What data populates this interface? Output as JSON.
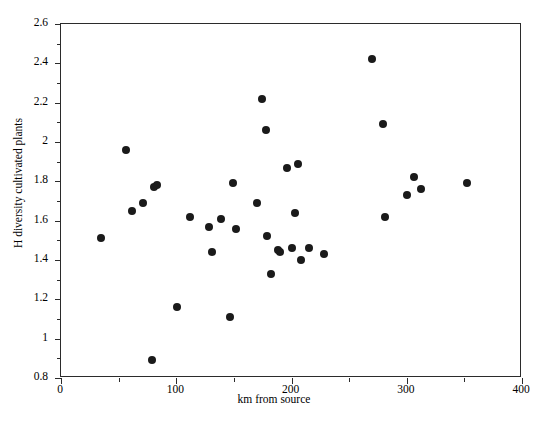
{
  "chart_data": {
    "type": "scatter",
    "title": "",
    "xlabel": "km from source",
    "ylabel": "H diversity cultivated plants",
    "xlim": [
      0,
      400
    ],
    "ylim": [
      0.8,
      2.6
    ],
    "x_major_ticks": [
      0,
      100,
      200,
      300,
      400
    ],
    "x_minor_ticks": [
      50,
      150,
      250,
      350
    ],
    "y_major_ticks": [
      0.8,
      1,
      1.2,
      1.4,
      1.6,
      1.8,
      2,
      2.2,
      2.4,
      2.6
    ],
    "y_minor_ticks": [
      0.9,
      1.1,
      1.3,
      1.5,
      1.7,
      1.9,
      2.1,
      2.3,
      2.5
    ],
    "x_tick_labels": [
      "0",
      "100",
      "200",
      "300",
      "400"
    ],
    "y_tick_labels": [
      "0.8",
      "1",
      "1.2",
      "1.4",
      "1.6",
      "1.8",
      "2",
      "2.2",
      "2.4",
      "2.6"
    ],
    "grid": false,
    "legend": null,
    "marker": "filled-circle",
    "marker_color": "#1a1a1a",
    "marker_size_px": 8,
    "n_points": 34,
    "points": [
      {
        "x": 35,
        "y": 1.51
      },
      {
        "x": 56,
        "y": 1.96
      },
      {
        "x": 62,
        "y": 1.65
      },
      {
        "x": 71,
        "y": 1.69
      },
      {
        "x": 79,
        "y": 0.89
      },
      {
        "x": 81,
        "y": 1.77
      },
      {
        "x": 83,
        "y": 1.78
      },
      {
        "x": 101,
        "y": 1.16
      },
      {
        "x": 112,
        "y": 1.62
      },
      {
        "x": 128,
        "y": 1.57
      },
      {
        "x": 131,
        "y": 1.44
      },
      {
        "x": 139,
        "y": 1.61
      },
      {
        "x": 147,
        "y": 1.11
      },
      {
        "x": 149,
        "y": 1.79
      },
      {
        "x": 152,
        "y": 1.56
      },
      {
        "x": 170,
        "y": 1.69
      },
      {
        "x": 174,
        "y": 2.22
      },
      {
        "x": 178,
        "y": 2.06
      },
      {
        "x": 179,
        "y": 1.52
      },
      {
        "x": 182,
        "y": 1.33
      },
      {
        "x": 188,
        "y": 1.45
      },
      {
        "x": 190,
        "y": 1.44
      },
      {
        "x": 196,
        "y": 1.87
      },
      {
        "x": 200,
        "y": 1.46
      },
      {
        "x": 203,
        "y": 1.64
      },
      {
        "x": 206,
        "y": 1.89
      },
      {
        "x": 208,
        "y": 1.4
      },
      {
        "x": 215,
        "y": 1.46
      },
      {
        "x": 228,
        "y": 1.43
      },
      {
        "x": 270,
        "y": 2.42
      },
      {
        "x": 279,
        "y": 2.09
      },
      {
        "x": 281,
        "y": 1.62
      },
      {
        "x": 300,
        "y": 1.73
      },
      {
        "x": 306,
        "y": 1.82
      },
      {
        "x": 312,
        "y": 1.76
      },
      {
        "x": 352,
        "y": 1.79
      }
    ]
  }
}
